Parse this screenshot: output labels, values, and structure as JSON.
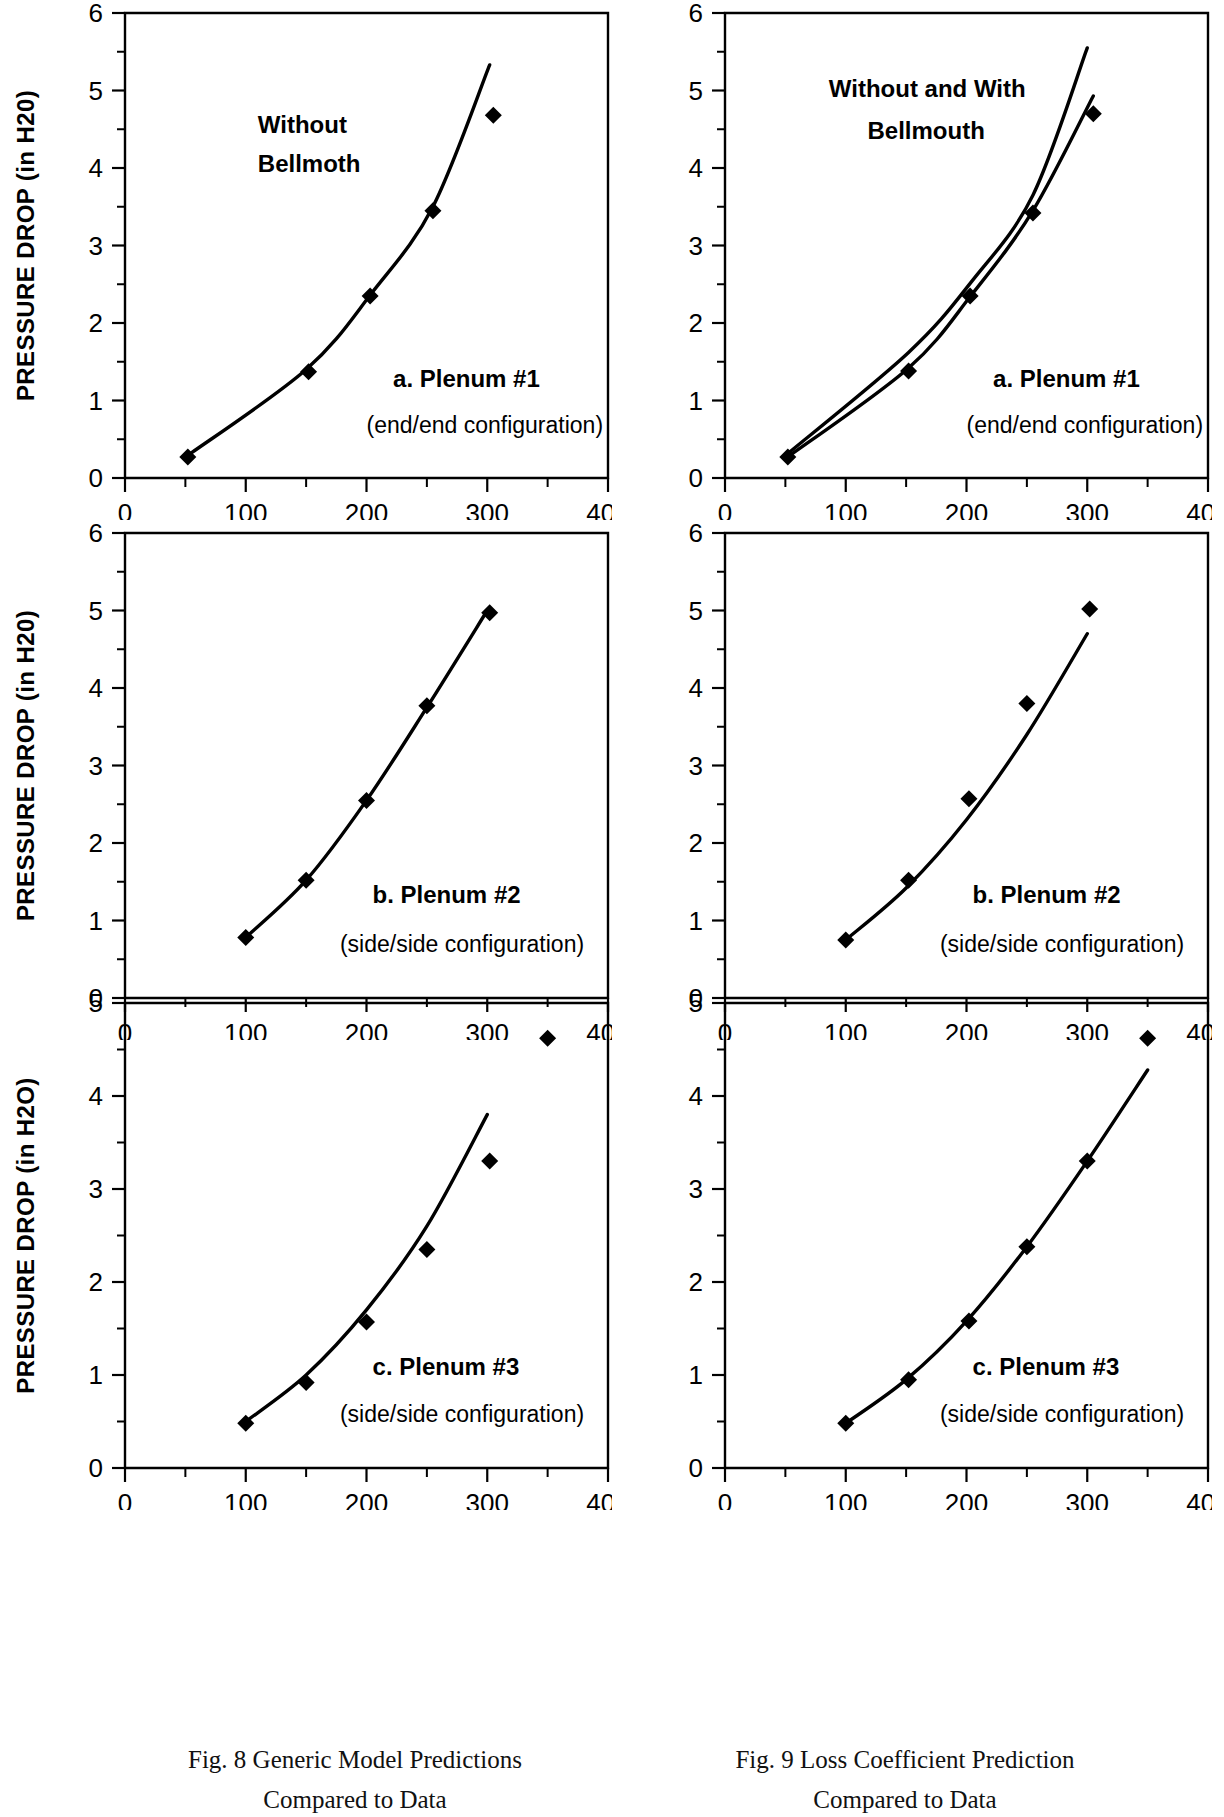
{
  "figure": {
    "axis_titles": {
      "y_top": "PRESSURE DROP (in H20)",
      "y_bottom": "PRESSURE DROP (in H2O)",
      "x": "FLOW RATE (CFM)"
    },
    "captions": {
      "left": {
        "line1": "Fig. 8  Generic Model Predictions",
        "line2": "Compared to Data"
      },
      "right": {
        "line1": "Fig. 9  Loss Coefficient Prediction",
        "line2": "Compared to Data"
      }
    }
  },
  "chart_data": [
    {
      "id": "fig8-a",
      "type": "line",
      "column": "left",
      "row": 0,
      "title": "",
      "xlabel": "",
      "ylabel": "PRESSURE DROP (in H20)",
      "xlim": [
        0,
        400
      ],
      "ylim": [
        0,
        6
      ],
      "xticks": [
        0,
        100,
        200,
        300,
        400
      ],
      "xtick_labels": [
        "0",
        "100",
        "200",
        "300",
        "400"
      ],
      "yticks": [
        0,
        1,
        2,
        3,
        4,
        5,
        6
      ],
      "ytick_labels": [
        "0",
        "1",
        "2",
        "3",
        "4",
        "5",
        "6"
      ],
      "minor_ticks": true,
      "grid": false,
      "legend": "none",
      "annotations": [
        {
          "text": "Without",
          "x": 110,
          "y": 4.45,
          "style": "bold"
        },
        {
          "text": "Bellmoth",
          "x": 110,
          "y": 3.95,
          "style": "bold"
        },
        {
          "text": "a. Plenum #1",
          "x": 222,
          "y": 1.18,
          "style": "bold"
        },
        {
          "text": "(end/end configuration)",
          "x": 200,
          "y": 0.58,
          "style": "plain"
        }
      ],
      "series": [
        {
          "name": "model prediction",
          "kind": "line",
          "x": [
            50,
            150,
            205,
            255,
            302
          ],
          "values": [
            0.27,
            1.4,
            2.4,
            3.5,
            5.33
          ]
        },
        {
          "name": "measured data",
          "kind": "markers",
          "x": [
            52,
            152,
            203,
            255,
            305
          ],
          "values": [
            0.27,
            1.37,
            2.35,
            3.45,
            4.68
          ]
        }
      ]
    },
    {
      "id": "fig9-a",
      "type": "line",
      "column": "right",
      "row": 0,
      "title": "",
      "xlabel": "",
      "ylabel": "",
      "xlim": [
        0,
        400
      ],
      "ylim": [
        0,
        6
      ],
      "xticks": [
        0,
        100,
        200,
        300,
        400
      ],
      "xtick_labels": [
        "0",
        "100",
        "200",
        "300",
        "400"
      ],
      "yticks": [
        0,
        1,
        2,
        3,
        4,
        5,
        6
      ],
      "ytick_labels": [
        "0",
        "1",
        "2",
        "3",
        "4",
        "5",
        "6"
      ],
      "minor_ticks": true,
      "grid": false,
      "legend": "none",
      "annotations": [
        {
          "text": "Without and With",
          "x": 86,
          "y": 4.92,
          "style": "bold"
        },
        {
          "text": "Bellmouth",
          "x": 118,
          "y": 4.38,
          "style": "bold"
        },
        {
          "text": "a. Plenum #1",
          "x": 222,
          "y": 1.18,
          "style": "bold"
        },
        {
          "text": "(end/end configuration)",
          "x": 200,
          "y": 0.58,
          "style": "plain"
        }
      ],
      "series": [
        {
          "name": "without bellmouth prediction",
          "kind": "line",
          "x": [
            50,
            152,
            205,
            255,
            300
          ],
          "values": [
            0.29,
            1.62,
            2.55,
            3.65,
            5.55
          ]
        },
        {
          "name": "with bellmouth prediction",
          "kind": "line",
          "x": [
            50,
            152,
            205,
            255,
            305
          ],
          "values": [
            0.25,
            1.42,
            2.38,
            3.45,
            4.93
          ]
        },
        {
          "name": "measured data",
          "kind": "markers",
          "x": [
            52,
            152,
            203,
            255,
            305
          ],
          "values": [
            0.27,
            1.38,
            2.35,
            3.42,
            4.7
          ]
        }
      ]
    },
    {
      "id": "fig8-b",
      "type": "line",
      "column": "left",
      "row": 1,
      "title": "",
      "xlabel": "",
      "ylabel": "PRESSURE DROP (in H20)",
      "xlim": [
        0,
        400
      ],
      "ylim": [
        0,
        6
      ],
      "xticks": [
        0,
        100,
        200,
        300,
        400
      ],
      "xtick_labels": [
        "0",
        "100",
        "200",
        "300",
        "400"
      ],
      "yticks": [
        0,
        1,
        2,
        3,
        4,
        5,
        6
      ],
      "ytick_labels": [
        "0",
        "1",
        "2",
        "3",
        "4",
        "5",
        "6"
      ],
      "minor_ticks": true,
      "grid": false,
      "legend": "none",
      "annotations": [
        {
          "text": "b. Plenum #2",
          "x": 205,
          "y": 1.22,
          "style": "bold"
        },
        {
          "text": "(side/side configuration)",
          "x": 178,
          "y": 0.6,
          "style": "plain"
        }
      ],
      "series": [
        {
          "name": "model prediction",
          "kind": "line",
          "x": [
            100,
            150,
            200,
            250,
            300
          ],
          "values": [
            0.78,
            1.52,
            2.55,
            3.75,
            5.0
          ]
        },
        {
          "name": "measured data",
          "kind": "markers",
          "x": [
            100,
            150,
            200,
            250,
            302
          ],
          "values": [
            0.78,
            1.52,
            2.55,
            3.77,
            4.97
          ]
        }
      ]
    },
    {
      "id": "fig9-b",
      "type": "line",
      "column": "right",
      "row": 1,
      "title": "",
      "xlabel": "",
      "ylabel": "",
      "xlim": [
        0,
        400
      ],
      "ylim": [
        0,
        6
      ],
      "xticks": [
        0,
        100,
        200,
        300,
        400
      ],
      "xtick_labels": [
        "0",
        "100",
        "200",
        "300",
        "400"
      ],
      "yticks": [
        0,
        1,
        2,
        3,
        4,
        5,
        6
      ],
      "ytick_labels": [
        "0",
        "1",
        "2",
        "3",
        "4",
        "5",
        "6"
      ],
      "minor_ticks": true,
      "grid": false,
      "legend": "none",
      "annotations": [
        {
          "text": "b. Plenum #2",
          "x": 205,
          "y": 1.22,
          "style": "bold"
        },
        {
          "text": "(side/side configuration)",
          "x": 178,
          "y": 0.6,
          "style": "plain"
        }
      ],
      "series": [
        {
          "name": "loss coefficient prediction",
          "kind": "line",
          "x": [
            100,
            150,
            200,
            250,
            300
          ],
          "values": [
            0.75,
            1.42,
            2.3,
            3.4,
            4.7
          ]
        },
        {
          "name": "measured data",
          "kind": "markers",
          "x": [
            100,
            152,
            202,
            250,
            302
          ],
          "values": [
            0.75,
            1.52,
            2.57,
            3.8,
            5.02
          ]
        }
      ]
    },
    {
      "id": "fig8-c",
      "type": "line",
      "column": "left",
      "row": 2,
      "title": "",
      "xlabel": "FLOW RATE (CFM)",
      "ylabel": "PRESSURE DROP (in H2O)",
      "xlim": [
        0,
        400
      ],
      "ylim": [
        0,
        5
      ],
      "xticks": [
        0,
        100,
        200,
        300,
        400
      ],
      "xtick_labels": [
        "0",
        "100",
        "200",
        "300",
        "400"
      ],
      "yticks": [
        0,
        1,
        2,
        3,
        4,
        5
      ],
      "ytick_labels": [
        "0",
        "1",
        "2",
        "3",
        "4",
        "5"
      ],
      "minor_ticks": true,
      "grid": false,
      "legend": "none",
      "annotations": [
        {
          "text": "c. Plenum #3",
          "x": 205,
          "y": 1.0,
          "style": "bold"
        },
        {
          "text": "(side/side configuration)",
          "x": 178,
          "y": 0.5,
          "style": "plain"
        }
      ],
      "series": [
        {
          "name": "model prediction",
          "kind": "line",
          "x": [
            100,
            150,
            200,
            250,
            300
          ],
          "values": [
            0.5,
            1.0,
            1.7,
            2.6,
            3.8
          ]
        },
        {
          "name": "measured data",
          "kind": "markers",
          "x": [
            100,
            150,
            200,
            250,
            302,
            350
          ],
          "values": [
            0.48,
            0.92,
            1.57,
            2.35,
            3.3,
            4.62
          ]
        }
      ]
    },
    {
      "id": "fig9-c",
      "type": "line",
      "column": "right",
      "row": 2,
      "title": "",
      "xlabel": "FLOW RATE (CFM)",
      "ylabel": "",
      "xlim": [
        0,
        400
      ],
      "ylim": [
        0,
        5
      ],
      "xticks": [
        0,
        100,
        200,
        300,
        400
      ],
      "xtick_labels": [
        "0",
        "100",
        "200",
        "300",
        "400"
      ],
      "yticks": [
        0,
        1,
        2,
        3,
        4,
        5
      ],
      "ytick_labels": [
        "0",
        "1",
        "2",
        "3",
        "4",
        "5"
      ],
      "minor_ticks": true,
      "grid": false,
      "legend": "none",
      "annotations": [
        {
          "text": "c. Plenum #3",
          "x": 205,
          "y": 1.0,
          "style": "bold"
        },
        {
          "text": "(side/side configuration)",
          "x": 178,
          "y": 0.5,
          "style": "plain"
        }
      ],
      "series": [
        {
          "name": "loss coefficient prediction",
          "kind": "line",
          "x": [
            100,
            150,
            200,
            250,
            300,
            350
          ],
          "values": [
            0.48,
            0.95,
            1.58,
            2.38,
            3.3,
            4.28
          ]
        },
        {
          "name": "measured data",
          "kind": "markers",
          "x": [
            100,
            152,
            202,
            250,
            300,
            350
          ],
          "values": [
            0.48,
            0.95,
            1.58,
            2.38,
            3.3,
            4.62
          ]
        }
      ]
    }
  ]
}
